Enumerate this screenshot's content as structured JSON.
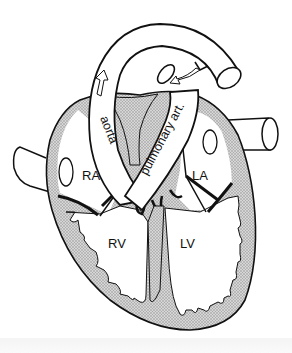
{
  "diagram": {
    "labels": {
      "right_atrium": "RA",
      "left_atrium": "LA",
      "right_ventricle": "RV",
      "left_ventricle": "LV",
      "aorta": "aorta",
      "pulmonary_artery": "pulmonary art."
    },
    "colors": {
      "outline": "#111111",
      "muscle_fill": "#c9c9c9",
      "chamber_fill": "#ffffff",
      "background": "#ffffff"
    }
  }
}
